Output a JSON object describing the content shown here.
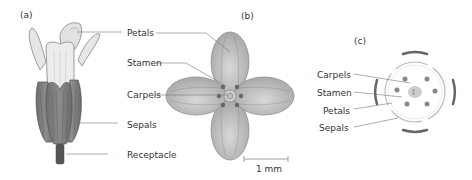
{
  "panels": {
    "a": {
      "label": "(a)"
    },
    "b": {
      "label": "(b)"
    },
    "c": {
      "label": "(c)"
    }
  },
  "labels_ab": {
    "petals": "Petals",
    "stamen": "Stamen",
    "carpels": "Carpels",
    "sepals": "Sepals",
    "receptacle": "Receptacle"
  },
  "labels_c": {
    "carpels": "Carpels",
    "stamen": "Stamen",
    "petals": "Petals",
    "sepals": "Sepals"
  },
  "scale_bar": {
    "label": "1 mm"
  },
  "colors": {
    "petal_light": "#e4e4e4",
    "petal_gray": "#b8b8b8",
    "sepal_dark": "#7a7a7a",
    "receptacle": "#555555",
    "line": "#666666"
  }
}
